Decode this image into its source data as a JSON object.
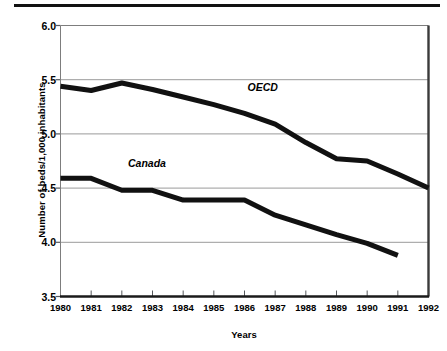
{
  "chart_data": {
    "type": "line",
    "title": "",
    "xlabel": "Years",
    "ylabel": "Number of beds/1,000 inhabitants",
    "x": [
      1980,
      1981,
      1982,
      1983,
      1984,
      1985,
      1986,
      1987,
      1988,
      1989,
      1990,
      1991,
      1992
    ],
    "categories": [
      "1980",
      "1981",
      "1982",
      "1983",
      "1984",
      "1985",
      "1986",
      "1987",
      "1988",
      "1989",
      "1990",
      "1991",
      "1992"
    ],
    "xlim": [
      1980,
      1992
    ],
    "ylim": [
      3.5,
      6.0
    ],
    "yticks": [
      3.5,
      4.0,
      4.5,
      5.0,
      5.5,
      6.0
    ],
    "ytick_labels": [
      "3.5",
      "4.0",
      "4.5",
      "5.0",
      "5.5",
      "6.0"
    ],
    "grid": "horizontal",
    "legend": "inline-annotations",
    "line_color": "#111111",
    "grid_color": "#9a9a9a",
    "axis_color": "#7d7d7d",
    "series": [
      {
        "name": "OECD",
        "annotation": "OECD",
        "values": [
          5.44,
          5.4,
          5.47,
          5.41,
          5.34,
          5.27,
          5.19,
          5.09,
          4.92,
          4.77,
          4.75,
          4.63,
          4.5
        ]
      },
      {
        "name": "Canada",
        "annotation": "Canada",
        "values": [
          4.59,
          4.59,
          4.48,
          4.48,
          4.39,
          4.39,
          4.39,
          4.25,
          4.16,
          4.07,
          3.99,
          3.88,
          null
        ]
      }
    ],
    "annotations": [
      {
        "text": "OECD",
        "x": 1986.1,
        "y": 5.42
      },
      {
        "text": "Canada",
        "x": 1982.2,
        "y": 4.72
      }
    ]
  }
}
